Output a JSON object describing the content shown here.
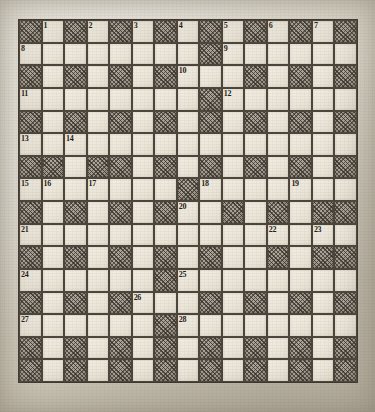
{
  "puzzle": {
    "title": "Crossword Puzzle Grid",
    "columns": 15,
    "rows": 16,
    "pencil_mark": "♂",
    "colors": {
      "paper": "#ddd8ca",
      "block_fill": "#a49d90",
      "open_fill": "#efeade",
      "ink": "#1d1a16",
      "rule": "#4a443b"
    },
    "clue_numbers": [
      1,
      2,
      3,
      4,
      5,
      6,
      7,
      8,
      9,
      10,
      11,
      12,
      13,
      14,
      15,
      16,
      17,
      18,
      19,
      20,
      21,
      22,
      23,
      24,
      25,
      26,
      27,
      28
    ],
    "grid": [
      [
        "block",
        "1",
        "block",
        "2",
        "block",
        "3",
        "block",
        "4",
        "block",
        "5",
        "block",
        "6",
        "block",
        "7",
        "block"
      ],
      [
        "8",
        "open",
        "open",
        "open",
        "open",
        "open",
        "open",
        "open",
        "block",
        "9",
        "open",
        "open",
        "open",
        "open",
        "open"
      ],
      [
        "block",
        "open",
        "block",
        "open",
        "block",
        "open",
        "block",
        "10",
        "open",
        "open",
        "block",
        "open",
        "block",
        "open",
        "block"
      ],
      [
        "11",
        "open",
        "open",
        "open",
        "open",
        "open",
        "open",
        "open",
        "block",
        "12",
        "open",
        "open",
        "open",
        "open",
        "open"
      ],
      [
        "block",
        "open",
        "block",
        "open",
        "block",
        "open",
        "block",
        "open",
        "block",
        "open",
        "block",
        "open",
        "block",
        "open",
        "block"
      ],
      [
        "13",
        "open",
        "14",
        "open",
        "open",
        "open",
        "open",
        "open",
        "open",
        "open",
        "open",
        "open",
        "open",
        "open",
        "open"
      ],
      [
        "block",
        "block",
        "open",
        "block",
        "block",
        "open",
        "block-mark",
        "open",
        "block",
        "open",
        "block",
        "open",
        "block",
        "open",
        "block"
      ],
      [
        "15",
        "16",
        "open",
        "17",
        "open",
        "open",
        "open",
        "block",
        "18",
        "open",
        "open",
        "open",
        "19",
        "open",
        "open"
      ],
      [
        "block",
        "open",
        "block",
        "open",
        "block",
        "open",
        "block",
        "20",
        "open",
        "block",
        "open",
        "block",
        "open",
        "block",
        "block"
      ],
      [
        "21",
        "open",
        "open",
        "open",
        "open",
        "open",
        "open",
        "open",
        "open",
        "open",
        "open",
        "22",
        "open",
        "23",
        "open"
      ],
      [
        "block",
        "open",
        "block",
        "open",
        "block",
        "open",
        "block",
        "open",
        "block",
        "open",
        "open",
        "block",
        "open",
        "block",
        "block"
      ],
      [
        "24",
        "open",
        "open",
        "open",
        "open",
        "open",
        "block",
        "25",
        "open",
        "open",
        "open",
        "open",
        "open",
        "open",
        "open"
      ],
      [
        "block",
        "open",
        "block",
        "open",
        "block",
        "26",
        "open",
        "open",
        "block",
        "open",
        "block",
        "open",
        "block",
        "open",
        "block"
      ],
      [
        "27",
        "open",
        "open",
        "open",
        "open",
        "open",
        "block",
        "28",
        "open",
        "open",
        "open",
        "open",
        "open",
        "open",
        "open"
      ],
      [
        "block",
        "open",
        "block",
        "open",
        "block",
        "open",
        "block",
        "open",
        "block",
        "open",
        "block",
        "open",
        "block",
        "open",
        "block"
      ],
      [
        "block",
        "open",
        "block",
        "open",
        "block",
        "open",
        "block",
        "open",
        "block",
        "open",
        "block",
        "open",
        "block",
        "open",
        "block"
      ]
    ]
  }
}
